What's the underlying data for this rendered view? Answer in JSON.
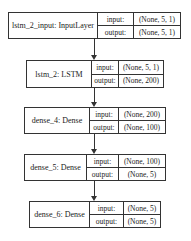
{
  "nodes": [
    {
      "name": "lstm_2_input: InputLayer",
      "input_label": "input:",
      "output_label": "output:",
      "input": "(None, 5, 1)",
      "output": "(None, 5, 1)"
    },
    {
      "name": "lstm_2: LSTM",
      "input_label": "input:",
      "output_label": "output:",
      "input": "(None, 5, 1)",
      "output": "(None, 200)"
    },
    {
      "name": "dense_4: Dense",
      "input_label": "input:",
      "output_label": "output:",
      "input": "(None, 200)",
      "output": "(None, 100)"
    },
    {
      "name": "dense_5: Dense",
      "input_label": "input:",
      "output_label": "output:",
      "input": "(None, 100)",
      "output": "(None, 5)"
    },
    {
      "name": "dense_6: Dense",
      "input_label": "input:",
      "output_label": "output:",
      "input": "(None, 5)",
      "output": "(None, 5)"
    }
  ]
}
